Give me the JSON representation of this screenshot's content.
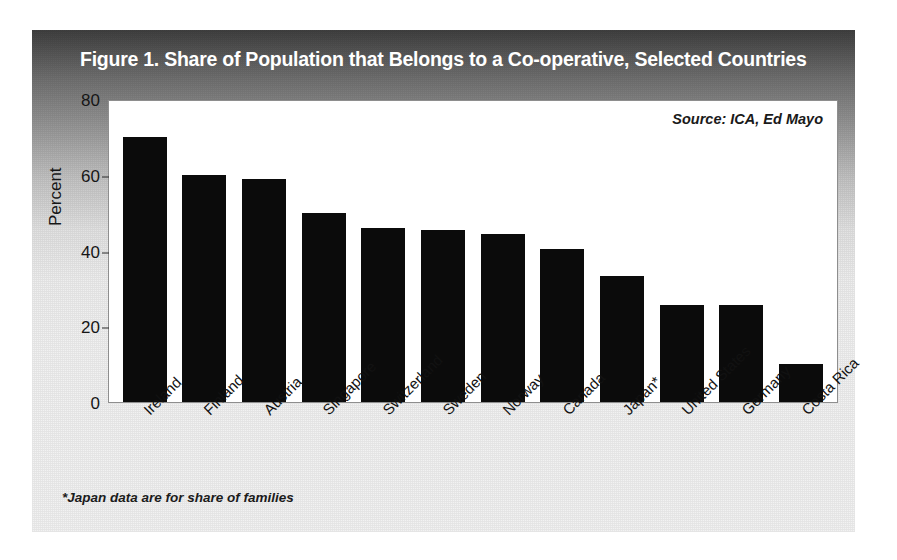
{
  "figure": {
    "title": "Figure 1.  Share of Population that Belongs to a Co-operative, Selected Countries",
    "source_note": "Source: ICA, Ed Mayo",
    "footnote": "*Japan data are for share of families",
    "title_band_color": "#3f3f3f",
    "bar_color": "#0b0b0b",
    "plot_background": "#ffffff"
  },
  "chart_data": {
    "type": "bar",
    "title": "Figure 1.  Share of Population that Belongs to a Co-operative, Selected Countries",
    "subtitle": "",
    "xlabel": "",
    "ylabel": "Percent",
    "ylim": [
      0,
      80
    ],
    "yticks": [
      0,
      20,
      40,
      60,
      80
    ],
    "ytick_labels": [
      "0",
      "20",
      "40",
      "60",
      "80"
    ],
    "grid": false,
    "legend": false,
    "legend_position": "none",
    "annotations": [
      "Source: ICA, Ed Mayo",
      "*Japan data are for share of families"
    ],
    "categories": [
      "Ireland",
      "Finland",
      "Austria",
      "Singapore",
      "Switzerland",
      "Sweden",
      "Norway",
      "Canada",
      "Japan*",
      "United States",
      "Germany",
      "Costa Rica"
    ],
    "values": [
      70,
      60,
      59,
      50,
      46,
      45.3,
      44.3,
      40.3,
      33.3,
      25.5,
      25.5,
      10
    ]
  }
}
